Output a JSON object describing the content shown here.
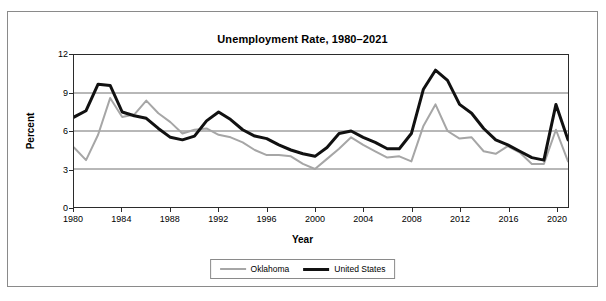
{
  "chart_data": {
    "type": "line",
    "title": "Unemployment Rate, 1980–2021",
    "xlabel": "Year",
    "ylabel": "Percent",
    "ylim": [
      0,
      12
    ],
    "xlim": [
      1980,
      2021
    ],
    "yticks": [
      "0",
      "3",
      "6",
      "9",
      "12"
    ],
    "ytick_values": [
      0,
      3,
      6,
      9,
      12
    ],
    "xticks": [
      "1980",
      "1984",
      "1988",
      "1992",
      "1996",
      "2000",
      "2004",
      "2008",
      "2012",
      "2016",
      "2020"
    ],
    "xtick_values": [
      1980,
      1984,
      1988,
      1992,
      1996,
      2000,
      2004,
      2008,
      2012,
      2016,
      2020
    ],
    "grid": "horizontal",
    "legend_position": "bottom",
    "x": [
      1980,
      1981,
      1982,
      1983,
      1984,
      1985,
      1986,
      1987,
      1988,
      1989,
      1990,
      1991,
      1992,
      1993,
      1994,
      1995,
      1996,
      1997,
      1998,
      1999,
      2000,
      2001,
      2002,
      2003,
      2004,
      2005,
      2006,
      2007,
      2008,
      2009,
      2010,
      2011,
      2012,
      2013,
      2014,
      2015,
      2016,
      2017,
      2018,
      2019,
      2020,
      2021
    ],
    "series": [
      {
        "name": "Oklahoma",
        "color": "#a6a6a6",
        "width": 2,
        "values": [
          4.7,
          3.7,
          5.7,
          8.6,
          7.1,
          7.3,
          8.4,
          7.4,
          6.7,
          5.8,
          6.1,
          6.2,
          5.7,
          5.5,
          5.1,
          4.5,
          4.1,
          4.1,
          4.0,
          3.4,
          3.0,
          3.8,
          4.6,
          5.5,
          4.9,
          4.4,
          3.9,
          4.0,
          3.6,
          6.4,
          8.1,
          6.0,
          5.4,
          5.5,
          4.4,
          4.2,
          4.8,
          4.3,
          3.4,
          3.4,
          6.1,
          3.6
        ]
      },
      {
        "name": "United States",
        "color": "#111111",
        "width": 3,
        "values": [
          7.1,
          7.6,
          9.7,
          9.6,
          7.5,
          7.2,
          7.0,
          6.2,
          5.5,
          5.3,
          5.6,
          6.8,
          7.5,
          6.9,
          6.1,
          5.6,
          5.4,
          4.9,
          4.5,
          4.2,
          4.0,
          4.7,
          5.8,
          6.0,
          5.5,
          5.1,
          4.6,
          4.6,
          5.8,
          9.3,
          10.8,
          10.0,
          8.1,
          7.4,
          6.2,
          5.3,
          4.9,
          4.4,
          3.9,
          3.7,
          8.1,
          5.3
        ]
      }
    ]
  },
  "legend": {
    "items": [
      {
        "label": "Oklahoma"
      },
      {
        "label": "United States"
      }
    ]
  }
}
